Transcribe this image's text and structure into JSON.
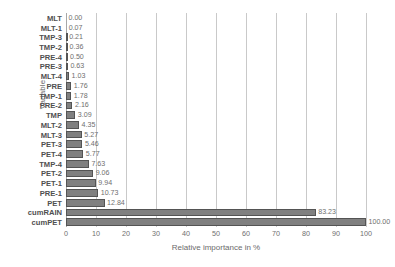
{
  "chart_data": {
    "type": "bar",
    "orientation": "horizontal",
    "title": "",
    "xlabel": "Relative importance in %",
    "ylabel": "Variable",
    "xlim": [
      0,
      100
    ],
    "xticks": [
      0,
      10,
      20,
      30,
      40,
      50,
      60,
      70,
      80,
      90,
      100
    ],
    "grid": "vertical",
    "legend": "none",
    "bar_color": "#808080",
    "bar_border_color": "#545454",
    "categories": [
      "MLT",
      "MLT-1",
      "TMP-3",
      "TMP-2",
      "PRE-4",
      "PRE-3",
      "MLT-4",
      "PRE",
      "TMP-1",
      "PRE-2",
      "TMP",
      "MLT-2",
      "MLT-3",
      "PET-3",
      "PET-4",
      "TMP-4",
      "PET-2",
      "PET-1",
      "PRE-1",
      "PET",
      "cumRAIN",
      "cumPET"
    ],
    "values": [
      0.0,
      0.07,
      0.21,
      0.36,
      0.5,
      0.63,
      1.03,
      1.76,
      1.78,
      2.16,
      3.09,
      4.35,
      5.27,
      5.46,
      5.77,
      7.63,
      9.06,
      9.94,
      10.73,
      12.84,
      83.23,
      100.0
    ],
    "data_labels": [
      "0.00",
      "0.07",
      "0.21",
      "0.36",
      "0.50",
      "0.63",
      "1.03",
      "1.76",
      "1.78",
      "2.16",
      "3.09",
      "4.35",
      "5.27",
      "5.46",
      "5.77",
      "7.63",
      "9.06",
      "9.94",
      "10.73",
      "12.84",
      "83.23",
      "100.00"
    ]
  }
}
